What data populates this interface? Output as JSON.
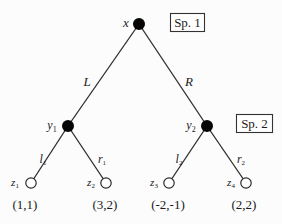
{
  "diagram": {
    "type": "game-tree",
    "players": [
      {
        "id": "player-1",
        "label": "Sp. 1"
      },
      {
        "id": "player-2",
        "label": "Sp. 2"
      }
    ],
    "nodes": {
      "root": {
        "name": "x",
        "sub": "",
        "player": "Sp. 1"
      },
      "y1": {
        "name": "y",
        "sub": "1",
        "player": "Sp. 2"
      },
      "y2": {
        "name": "y",
        "sub": "2",
        "player": "Sp. 2"
      },
      "z1": {
        "name": "z",
        "sub": "1",
        "payoff": "(1,1)"
      },
      "z2": {
        "name": "z",
        "sub": "2",
        "payoff": "(3,2)"
      },
      "z3": {
        "name": "z",
        "sub": "3",
        "payoff": "(-2,-1)"
      },
      "z4": {
        "name": "z",
        "sub": "4",
        "payoff": "(2,2)"
      }
    },
    "actions": {
      "L": {
        "name": "L",
        "sub": ""
      },
      "R": {
        "name": "R",
        "sub": ""
      },
      "l1": {
        "name": "l",
        "sub": "1"
      },
      "r1": {
        "name": "r",
        "sub": "1"
      },
      "l2": {
        "name": "l",
        "sub": "2"
      },
      "r2": {
        "name": "r",
        "sub": "2"
      }
    }
  }
}
